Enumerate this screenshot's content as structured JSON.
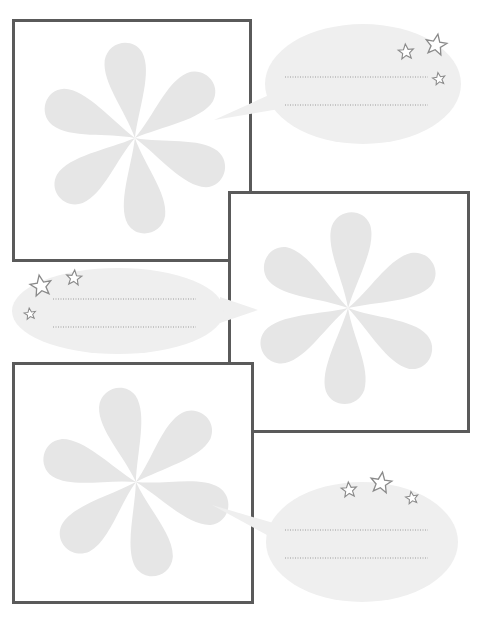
{
  "page": {
    "colors": {
      "frame_border": "#5a5a5a",
      "flower_fill": "#e6e6e6",
      "bubble_fill": "#efefef",
      "dotted_line": "#9a9a9a",
      "star_stroke": "#8a8a8a"
    }
  },
  "panels": [
    {
      "id": "panel-1",
      "flower_icon": "flower-icon",
      "bubble": {
        "side": "right",
        "lines": 2,
        "stars": 3
      }
    },
    {
      "id": "panel-2",
      "flower_icon": "flower-icon",
      "bubble": {
        "side": "left",
        "lines": 2,
        "stars": 3
      }
    },
    {
      "id": "panel-3",
      "flower_icon": "flower-icon",
      "bubble": {
        "side": "right",
        "lines": 2,
        "stars": 3
      }
    }
  ]
}
